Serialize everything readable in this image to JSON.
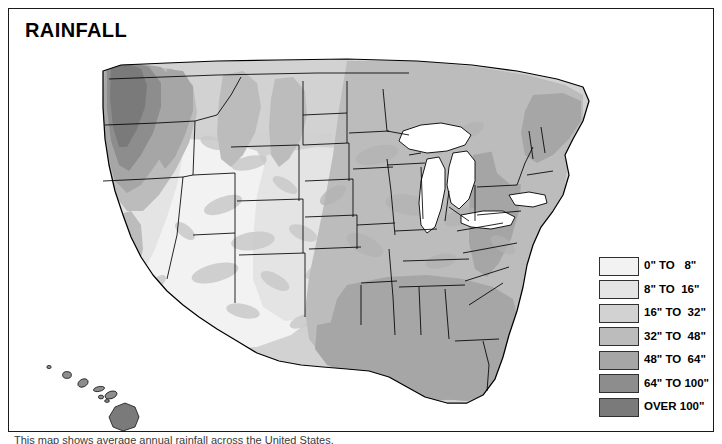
{
  "title": "RAINFALL",
  "caption": "This map shows average annual rainfall across the United States.",
  "legend": {
    "items": [
      {
        "label": "0\" TO   8\"",
        "color": "#f2f2f2",
        "min": 0,
        "max": 8
      },
      {
        "label": "8\" TO  16\"",
        "color": "#e4e4e4",
        "min": 8,
        "max": 16
      },
      {
        "label": "16\" TO  32\"",
        "color": "#d2d2d2",
        "min": 16,
        "max": 32
      },
      {
        "label": "32\" TO  48\"",
        "color": "#bcbcbc",
        "min": 32,
        "max": 48
      },
      {
        "label": "48\" TO  64\"",
        "color": "#a6a6a6",
        "min": 48,
        "max": 64
      },
      {
        "label": "64\" TO 100\"",
        "color": "#8d8d8d",
        "min": 64,
        "max": 100
      },
      {
        "label": "OVER 100\"",
        "color": "#7a7a7a",
        "min": 100,
        "max": null
      }
    ]
  },
  "map": {
    "region_name": "United States",
    "insets": [
      "Hawaii"
    ],
    "water_color": "#ffffff",
    "border_color": "#000000",
    "regions": [
      {
        "name": "pacific-northwest-coast",
        "band": "OVER 100\""
      },
      {
        "name": "cascade-range",
        "band": "64\" TO 100\""
      },
      {
        "name": "northern-rockies",
        "band": "16\" TO  32\""
      },
      {
        "name": "great-basin",
        "band": "0\" TO   8\""
      },
      {
        "name": "desert-southwest",
        "band": "0\" TO   8\""
      },
      {
        "name": "southern-california",
        "band": "8\" TO  16\""
      },
      {
        "name": "great-plains",
        "band": "16\" TO  32\""
      },
      {
        "name": "midwest",
        "band": "32\" TO  48\""
      },
      {
        "name": "gulf-coast",
        "band": "48\" TO  64\""
      },
      {
        "name": "southeast",
        "band": "48\" TO  64\""
      },
      {
        "name": "florida",
        "band": "48\" TO  64\""
      },
      {
        "name": "northeast",
        "band": "32\" TO  48\""
      },
      {
        "name": "appalachians",
        "band": "48\" TO  64\""
      },
      {
        "name": "hawaii",
        "band": "64\" TO 100\""
      }
    ]
  }
}
